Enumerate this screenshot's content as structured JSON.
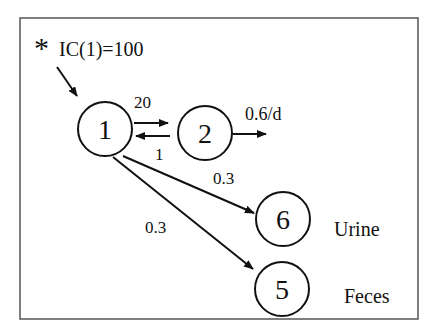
{
  "diagram": {
    "initial_condition": {
      "marker": "*",
      "label": "IC(1)=100"
    },
    "compartments": [
      {
        "id": "1",
        "label": "1"
      },
      {
        "id": "2",
        "label": "2"
      },
      {
        "id": "6",
        "label": "6",
        "name": "Urine"
      },
      {
        "id": "5",
        "label": "5",
        "name": "Feces"
      }
    ],
    "flows": [
      {
        "from": "1",
        "to": "2",
        "rate": "20"
      },
      {
        "from": "2",
        "to": "1",
        "rate": "1"
      },
      {
        "from": "2",
        "to": "out",
        "rate": "0.6/d"
      },
      {
        "from": "1",
        "to": "6",
        "rate": "0.3"
      },
      {
        "from": "1",
        "to": "5",
        "rate": "0.3"
      }
    ],
    "colors": {
      "stroke": "#111111",
      "frame": "#555555",
      "background": "#ffffff"
    }
  }
}
